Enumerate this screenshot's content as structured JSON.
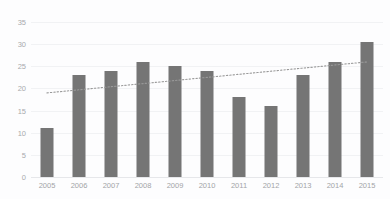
{
  "chart_data": {
    "type": "bar",
    "title": "",
    "xlabel": "",
    "ylabel": "",
    "categories": [
      "2005",
      "2006",
      "2007",
      "2008",
      "2009",
      "2010",
      "2011",
      "2012",
      "2013",
      "2014",
      "2015"
    ],
    "values": [
      11,
      23,
      24,
      26,
      25,
      24,
      18,
      16,
      23,
      26,
      30.5
    ],
    "ylim": [
      0,
      35
    ],
    "yticks": [
      0,
      5,
      10,
      15,
      20,
      25,
      30,
      35
    ],
    "ytick_labels": [
      "0",
      "5",
      "10",
      "15",
      "20",
      "25",
      "30",
      "35"
    ],
    "grid": true,
    "legend": "none",
    "series": [
      {
        "name": "values",
        "values": [
          11,
          23,
          24,
          26,
          25,
          24,
          18,
          16,
          23,
          26,
          30.5
        ]
      }
    ],
    "annotations": [
      {
        "type": "trendline",
        "style": "dotted",
        "color": "#9a9a9a",
        "start": {
          "x": "2005",
          "y": 19.0
        },
        "end": {
          "x": "2015",
          "y": 26.0
        }
      }
    ],
    "colors": {
      "bar": "#757575",
      "background": "#fdfdfe",
      "gridline": "#f1f2f4",
      "axis": "#e6e7ea",
      "tick_label": "#a5a7aa",
      "trendline": "#9a9a9a"
    }
  },
  "header": {
    "clipped_title": ""
  }
}
